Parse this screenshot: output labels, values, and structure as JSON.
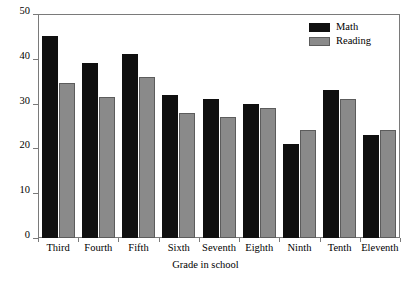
{
  "chart_data": {
    "type": "bar",
    "title": "",
    "subtitle": "",
    "xlabel": "Grade in school",
    "ylabel": "",
    "categories": [
      "Third",
      "Fourth",
      "Fifth",
      "Sixth",
      "Seventh",
      "Eighth",
      "Ninth",
      "Tenth",
      "Eleventh"
    ],
    "series": [
      {
        "name": "Math",
        "color": "#0f0f0f",
        "values": [
          45,
          39,
          41,
          32,
          31,
          30,
          21,
          33,
          23
        ]
      },
      {
        "name": "Reading",
        "color": "#8a8a8a",
        "values": [
          34.5,
          31.5,
          36,
          28,
          27,
          29,
          24,
          31,
          24
        ]
      }
    ],
    "ylim": [
      0,
      50
    ],
    "yticks": [
      0,
      10,
      20,
      30,
      40,
      50
    ],
    "ytick_labels": [
      "0",
      "10",
      "20",
      "30",
      "40",
      "50"
    ],
    "grid": false,
    "legend_position": "top-right",
    "legend_entries": [
      "Math",
      "Reading"
    ],
    "annotations": []
  },
  "legend": {
    "items": [
      {
        "label": "Math",
        "swatch": "math-swatch"
      },
      {
        "label": "Reading",
        "swatch": "reading-swatch"
      }
    ]
  },
  "axes": {
    "x_title": "Grade in school"
  }
}
